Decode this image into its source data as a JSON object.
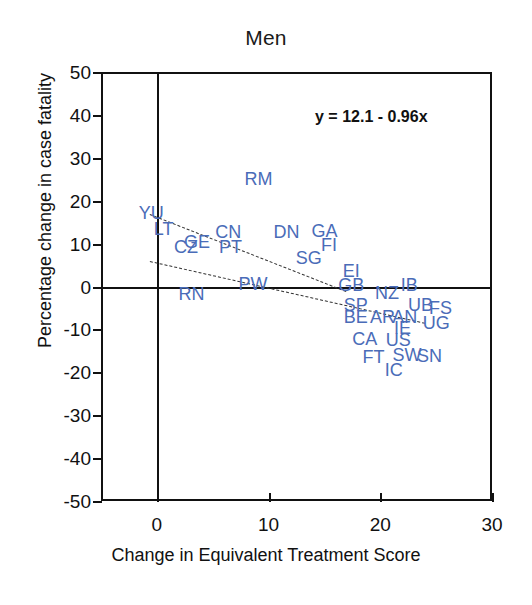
{
  "chart_data": {
    "type": "scatter",
    "title": "Men",
    "xlabel": "Change in Equivalent Treatment Score",
    "ylabel": "Percentage change in case fatality",
    "xlim": [
      -5,
      30
    ],
    "ylim": [
      -50,
      50
    ],
    "xticks": [
      "0",
      "10",
      "20",
      "30"
    ],
    "xtick_values": [
      0,
      10,
      20,
      30
    ],
    "yticks": [
      "50",
      "40",
      "30",
      "20",
      "10",
      "0",
      "-10",
      "-20",
      "-30",
      "-40",
      "-50"
    ],
    "ytick_values": [
      50,
      40,
      30,
      20,
      10,
      0,
      -10,
      -20,
      -30,
      -40,
      -50
    ],
    "grid": false,
    "legend": "none",
    "annotation": "y = 12.1 - 0.96x",
    "regression": {
      "intercept": 12.1,
      "slope": -0.96
    },
    "point_label_color": "#4a6cb8",
    "axis_color": "#111111",
    "points": [
      {
        "label": "RM",
        "x": 9.1,
        "y": 25.0
      },
      {
        "label": "YU",
        "x": -0.5,
        "y": 17.2
      },
      {
        "label": "LT",
        "x": 0.6,
        "y": 13.4
      },
      {
        "label": "CZ",
        "x": 2.6,
        "y": 9.2
      },
      {
        "label": "GE",
        "x": 3.6,
        "y": 10.4
      },
      {
        "label": "CN",
        "x": 6.4,
        "y": 12.6
      },
      {
        "label": "PT",
        "x": 6.6,
        "y": 9.2
      },
      {
        "label": "DN",
        "x": 11.6,
        "y": 12.6
      },
      {
        "label": "GA",
        "x": 15.0,
        "y": 13.0
      },
      {
        "label": "FI",
        "x": 15.4,
        "y": 9.6
      },
      {
        "label": "SG",
        "x": 13.6,
        "y": 6.6
      },
      {
        "label": "EI",
        "x": 17.4,
        "y": 3.6
      },
      {
        "label": "GB",
        "x": 17.4,
        "y": 0.4
      },
      {
        "label": "RN",
        "x": 3.1,
        "y": -1.8
      },
      {
        "label": "PW",
        "x": 8.6,
        "y": 0.6
      },
      {
        "label": "NZ",
        "x": 20.6,
        "y": -1.6
      },
      {
        "label": "IB",
        "x": 22.6,
        "y": 0.4
      },
      {
        "label": "SP",
        "x": 17.8,
        "y": -4.2
      },
      {
        "label": "UB",
        "x": 23.6,
        "y": -4.4
      },
      {
        "label": "FS",
        "x": 25.4,
        "y": -5.0
      },
      {
        "label": "BE",
        "x": 17.8,
        "y": -7.2
      },
      {
        "label": "AR",
        "x": 20.2,
        "y": -7.0
      },
      {
        "label": "AN",
        "x": 22.2,
        "y": -7.2
      },
      {
        "label": "UG",
        "x": 25.0,
        "y": -8.4
      },
      {
        "label": "IE",
        "x": 22.0,
        "y": -9.6
      },
      {
        "label": "CA",
        "x": 18.6,
        "y": -12.2
      },
      {
        "label": "US",
        "x": 21.6,
        "y": -12.4
      },
      {
        "label": "SW",
        "x": 22.4,
        "y": -16.0
      },
      {
        "label": "SN",
        "x": 24.4,
        "y": -16.2
      },
      {
        "label": "FT",
        "x": 19.4,
        "y": -16.4
      },
      {
        "label": "IC",
        "x": 21.2,
        "y": -19.4
      }
    ],
    "dashed_lines": [
      {
        "name": "upper-confidence-band",
        "x1": -0.6,
        "y1": 17.0,
        "x2": 17.0,
        "y2": -1.0
      },
      {
        "name": "lower-confidence-band",
        "x1": -0.6,
        "y1": 6.0,
        "x2": 24.0,
        "y2": -8.4
      }
    ]
  }
}
